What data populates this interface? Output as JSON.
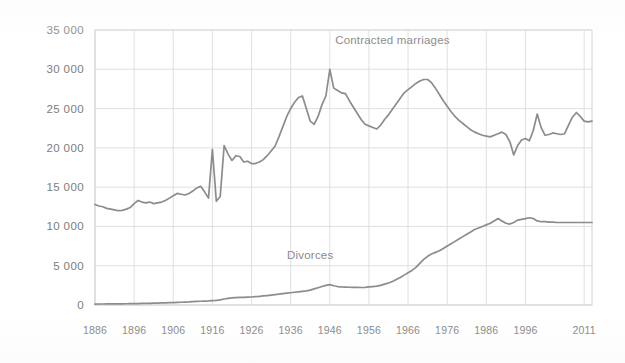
{
  "chart_data": {
    "type": "line",
    "title": "",
    "subtitle": "",
    "xlabel": "",
    "ylabel": "",
    "xlim": [
      1886,
      2013
    ],
    "ylim": [
      0,
      35000
    ],
    "grid": true,
    "legend_position": "inline-annotations",
    "y_ticks": [
      "0",
      "5 000",
      "10 000",
      "15 000",
      "20 000",
      "25 000",
      "30 000",
      "35 000"
    ],
    "y_tick_values": [
      0,
      5000,
      10000,
      15000,
      20000,
      25000,
      30000,
      35000
    ],
    "x_ticks": [
      "1886",
      "1896",
      "1906",
      "1916",
      "1926",
      "1936",
      "1946",
      "1956",
      "1966",
      "1976",
      "1986",
      "1996",
      "2011"
    ],
    "x_tick_values": [
      1886,
      1896,
      1906,
      1916,
      1926,
      1936,
      1946,
      1956,
      1966,
      1976,
      1986,
      1996,
      2011
    ],
    "annotations": [
      {
        "text": "Contracted marriages",
        "x": 1962,
        "y": 33200
      },
      {
        "text": "Divorces",
        "x": 1941,
        "y": 5900
      }
    ],
    "series": [
      {
        "name": "Contracted marriages",
        "color": "#8c8c8c",
        "x": [
          1886,
          1887,
          1888,
          1889,
          1890,
          1891,
          1892,
          1893,
          1894,
          1895,
          1896,
          1897,
          1898,
          1899,
          1900,
          1901,
          1902,
          1903,
          1904,
          1905,
          1906,
          1907,
          1908,
          1909,
          1910,
          1911,
          1912,
          1913,
          1914,
          1915,
          1916,
          1917,
          1918,
          1919,
          1920,
          1921,
          1922,
          1923,
          1924,
          1925,
          1926,
          1927,
          1928,
          1929,
          1930,
          1931,
          1932,
          1933,
          1934,
          1935,
          1936,
          1937,
          1938,
          1939,
          1940,
          1941,
          1942,
          1943,
          1944,
          1945,
          1946,
          1947,
          1948,
          1949,
          1950,
          1951,
          1952,
          1953,
          1954,
          1955,
          1956,
          1957,
          1958,
          1959,
          1960,
          1961,
          1962,
          1963,
          1964,
          1965,
          1966,
          1967,
          1968,
          1969,
          1970,
          1971,
          1972,
          1973,
          1974,
          1975,
          1976,
          1977,
          1978,
          1979,
          1980,
          1981,
          1982,
          1983,
          1984,
          1985,
          1986,
          1987,
          1988,
          1989,
          1990,
          1991,
          1992,
          1993,
          1994,
          1995,
          1996,
          1997,
          1998,
          1999,
          2000,
          2001,
          2002,
          2003,
          2004,
          2005,
          2006,
          2007,
          2008,
          2009,
          2010,
          2011,
          2012,
          2013
        ],
        "values": [
          12800,
          12600,
          12500,
          12300,
          12200,
          12100,
          12000,
          12050,
          12200,
          12400,
          12900,
          13300,
          13100,
          13000,
          13100,
          12900,
          13000,
          13100,
          13300,
          13600,
          13900,
          14200,
          14100,
          14000,
          14200,
          14500,
          14900,
          15100,
          14400,
          13600,
          19800,
          13200,
          13800,
          20300,
          19200,
          18400,
          19000,
          18900,
          18200,
          18300,
          18000,
          18000,
          18200,
          18500,
          19000,
          19600,
          20200,
          21400,
          22700,
          24000,
          25000,
          25800,
          26400,
          26600,
          25000,
          23400,
          23000,
          24000,
          25500,
          26600,
          30000,
          27600,
          27300,
          27000,
          26900,
          26000,
          25200,
          24400,
          23600,
          23000,
          22800,
          22600,
          22400,
          22900,
          23600,
          24200,
          24900,
          25600,
          26300,
          27000,
          27400,
          27800,
          28200,
          28500,
          28700,
          28700,
          28300,
          27600,
          26800,
          26000,
          25300,
          24600,
          24000,
          23500,
          23100,
          22700,
          22300,
          22000,
          21800,
          21600,
          21500,
          21400,
          21600,
          21800,
          22000,
          21700,
          20800,
          19100,
          20300,
          21000,
          21200,
          20900,
          22200,
          24300,
          22600,
          21600,
          21700,
          21900,
          21800,
          21700,
          21800,
          22900,
          23900,
          24500,
          24000,
          23400,
          23300,
          23400
        ]
      },
      {
        "name": "Divorces",
        "color": "#8c8c8c",
        "x": [
          1886,
          1887,
          1888,
          1889,
          1890,
          1891,
          1892,
          1893,
          1894,
          1895,
          1896,
          1897,
          1898,
          1899,
          1900,
          1901,
          1902,
          1903,
          1904,
          1905,
          1906,
          1907,
          1908,
          1909,
          1910,
          1911,
          1912,
          1913,
          1914,
          1915,
          1916,
          1917,
          1918,
          1919,
          1920,
          1921,
          1922,
          1923,
          1924,
          1925,
          1926,
          1927,
          1928,
          1929,
          1930,
          1931,
          1932,
          1933,
          1934,
          1935,
          1936,
          1937,
          1938,
          1939,
          1940,
          1941,
          1942,
          1943,
          1944,
          1945,
          1946,
          1947,
          1948,
          1949,
          1950,
          1951,
          1952,
          1953,
          1954,
          1955,
          1956,
          1957,
          1958,
          1959,
          1960,
          1961,
          1962,
          1963,
          1964,
          1965,
          1966,
          1967,
          1968,
          1969,
          1970,
          1971,
          1972,
          1973,
          1974,
          1975,
          1976,
          1977,
          1978,
          1979,
          1980,
          1981,
          1982,
          1983,
          1984,
          1985,
          1986,
          1987,
          1988,
          1989,
          1990,
          1991,
          1992,
          1993,
          1994,
          1995,
          1996,
          1997,
          1998,
          1999,
          2000,
          2001,
          2002,
          2003,
          2004,
          2005,
          2006,
          2007,
          2008,
          2009,
          2010,
          2011,
          2012,
          2013
        ],
        "values": [
          120,
          125,
          130,
          135,
          140,
          145,
          150,
          155,
          160,
          165,
          175,
          185,
          195,
          205,
          215,
          230,
          245,
          260,
          275,
          290,
          310,
          330,
          350,
          370,
          390,
          420,
          450,
          480,
          500,
          520,
          560,
          600,
          650,
          760,
          850,
          900,
          940,
          960,
          980,
          1000,
          1020,
          1060,
          1100,
          1150,
          1200,
          1260,
          1320,
          1380,
          1440,
          1500,
          1560,
          1620,
          1680,
          1740,
          1800,
          1900,
          2050,
          2200,
          2350,
          2500,
          2600,
          2450,
          2350,
          2300,
          2280,
          2260,
          2250,
          2240,
          2230,
          2250,
          2300,
          2350,
          2400,
          2500,
          2650,
          2800,
          3000,
          3250,
          3500,
          3800,
          4100,
          4400,
          4800,
          5300,
          5800,
          6200,
          6500,
          6700,
          6900,
          7200,
          7500,
          7800,
          8100,
          8400,
          8700,
          9000,
          9300,
          9600,
          9800,
          10000,
          10200,
          10400,
          10700,
          11000,
          10700,
          10400,
          10300,
          10500,
          10800,
          10900,
          11000,
          11100,
          11000,
          10700,
          10600,
          10600,
          10550,
          10550,
          10500,
          10500,
          10500,
          10500,
          10500,
          10500,
          10500,
          10500,
          10500,
          10500
        ]
      }
    ]
  }
}
